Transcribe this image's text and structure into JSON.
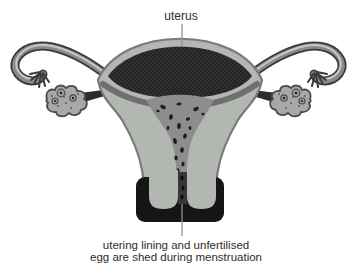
{
  "labels": {
    "top": "uterus",
    "bottom_line1": "utering lining and unfertilised",
    "bottom_line2": "egg are shed during menstruation"
  },
  "colors": {
    "background": "#ffffff",
    "wall": "#b3b7b2",
    "wall-outline": "#7a7a7a",
    "lining": "#242424",
    "lining-dot": "#3e3e3e",
    "inner-shadow": "#6f6f6f",
    "cavity": "#8d8d8d",
    "clot": "#1c1c1c",
    "cervix": "#151515",
    "channel": "#383838",
    "tube-outer": "#3a3a3a",
    "tube-mid": "#8a8a8a",
    "tube-stripe": "#c8c8c8",
    "ovary": "#a8a8a8",
    "ovary-outline": "#4c4c4c",
    "follicle-dot": "#222222",
    "ligament": "#2c2c2c",
    "pointer": "#909090",
    "text": "#2d2d2d"
  }
}
